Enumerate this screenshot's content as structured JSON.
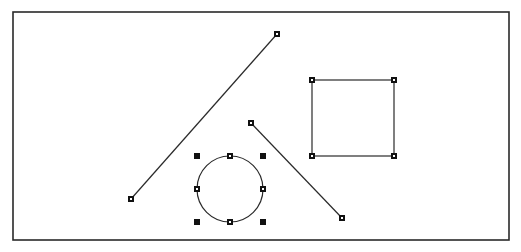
{
  "canvas": {
    "frame": {
      "x": 13,
      "y": 12,
      "width": 496,
      "height": 228
    },
    "colors": {
      "stroke": "#2a2a2a",
      "handle": "#111111",
      "background": "#ffffff"
    }
  },
  "shapes": [
    {
      "type": "line",
      "name": "line-1",
      "x1": 131,
      "y1": 199,
      "x2": 277,
      "y2": 34,
      "selected": true
    },
    {
      "type": "line",
      "name": "line-2",
      "x1": 251,
      "y1": 123,
      "x2": 342,
      "y2": 218,
      "selected": true
    },
    {
      "type": "rectangle",
      "name": "rectangle-1",
      "x": 312,
      "y": 80,
      "width": 82,
      "height": 76,
      "selected": true
    },
    {
      "type": "circle",
      "name": "circle-1",
      "cx": 230,
      "cy": 189,
      "r": 33,
      "selected": true
    }
  ]
}
